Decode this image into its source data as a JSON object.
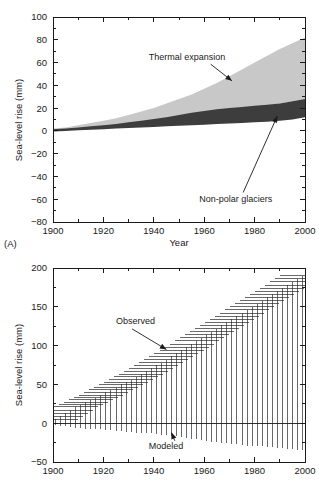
{
  "figure": {
    "panel_a_tag": "(A)",
    "axis_title_y": "Sea-level rise (mm)",
    "axis_title_x": "Year"
  },
  "panel_a": {
    "tag": "(A)",
    "ylabel": "Sea-level rise (mm)",
    "xlabel": "Year",
    "annotation_thermal": "Thermal expansion",
    "annotation_glaciers": "Non-polar glaciers"
  },
  "panel_b": {
    "ylabel": "Sea-level rise (mm)",
    "annotation_observed": "Observed",
    "annotation_modeled": "Modeled"
  },
  "colors": {
    "band_thermal": "#c8c8c8",
    "band_glaciers": "#3d3d3d",
    "axis": "#1a1a1a",
    "errorbar": "#2a2a2a",
    "background": "#ffffff"
  },
  "chart_data": [
    {
      "type": "area",
      "id": "panel-a",
      "title": "",
      "xlabel": "Year",
      "ylabel": "Sea-level rise (mm)",
      "xlim": [
        1900,
        2000
      ],
      "ylim": [
        -80,
        100
      ],
      "xticks": [
        1900,
        1920,
        1940,
        1960,
        1980,
        2000
      ],
      "yticks": [
        -80,
        -60,
        -40,
        -20,
        0,
        20,
        40,
        60,
        80,
        100
      ],
      "xtick_labels": [
        "1900",
        "1920",
        "1940",
        "1960",
        "1980",
        "2000"
      ],
      "ytick_labels": [
        "100",
        "80",
        "60",
        "40",
        "20",
        "0",
        "-20",
        "-40",
        "-60",
        "-80"
      ],
      "grid": false,
      "legend": "annotations",
      "annotations": [
        {
          "text": "Thermal expansion",
          "x": 1938,
          "y": 62,
          "arrow_to_x": 1971,
          "arrow_to_y": 44
        },
        {
          "text": "Non-polar glaciers",
          "x": 1958,
          "y": -62,
          "arrow_to_x": 1989,
          "arrow_to_y": 13
        }
      ],
      "x": [
        1900,
        1905,
        1910,
        1915,
        1920,
        1925,
        1930,
        1935,
        1940,
        1945,
        1950,
        1955,
        1960,
        1965,
        1970,
        1975,
        1980,
        1985,
        1990,
        1995,
        2000
      ],
      "series": [
        {
          "name": "Thermal expansion",
          "color": "#c8c8c8",
          "upper": [
            2,
            3,
            5,
            7,
            9,
            11,
            14,
            17,
            20,
            24,
            28,
            32,
            37,
            42,
            48,
            54,
            60,
            66,
            72,
            77,
            82
          ],
          "lower": [
            0,
            0.5,
            1,
            1.5,
            2,
            3,
            4,
            5,
            6,
            7,
            9,
            10,
            12,
            14,
            16,
            18,
            20,
            22,
            24,
            26,
            28
          ]
        },
        {
          "name": "Non-polar glaciers",
          "color": "#3d3d3d",
          "upper": [
            1.5,
            2,
            3,
            4,
            5,
            6,
            7.5,
            9,
            10.5,
            12,
            14,
            16,
            17.5,
            19,
            20,
            21,
            22,
            23,
            24,
            26,
            28
          ],
          "lower": [
            -0.5,
            0,
            0.5,
            1,
            1.5,
            2,
            2.5,
            3,
            3.5,
            4,
            4.5,
            5,
            5.5,
            6,
            6.5,
            7,
            7.5,
            8,
            9,
            10,
            12
          ]
        }
      ]
    },
    {
      "type": "errorbar",
      "id": "panel-b",
      "title": "",
      "xlabel": "",
      "ylabel": "Sea-level rise (mm)",
      "xlim": [
        1900,
        2000
      ],
      "ylim": [
        -50,
        200
      ],
      "xticks": [
        1900,
        1920,
        1940,
        1960,
        1980,
        2000
      ],
      "yticks": [
        -50,
        0,
        50,
        100,
        150,
        200
      ],
      "xtick_labels": [
        "1900",
        "1920",
        "1940",
        "1960",
        "1980",
        "2000"
      ],
      "ytick_labels": [
        "200",
        "150",
        "100",
        "50",
        "0",
        "-50"
      ],
      "grid": false,
      "annotations": [
        {
          "text": "Observed",
          "x": 1925,
          "y": 128,
          "arrow_to_x": 1945,
          "arrow_to_y": 95
        },
        {
          "text": "Modeled",
          "x": 1938,
          "y": -33,
          "arrow_to_x": 1947,
          "arrow_to_y": -12
        }
      ],
      "x": [
        1901,
        1903,
        1905,
        1907,
        1909,
        1911,
        1913,
        1915,
        1917,
        1919,
        1921,
        1923,
        1925,
        1927,
        1929,
        1931,
        1933,
        1935,
        1937,
        1939,
        1941,
        1943,
        1945,
        1947,
        1949,
        1951,
        1953,
        1955,
        1957,
        1959,
        1961,
        1963,
        1965,
        1967,
        1969,
        1971,
        1973,
        1975,
        1977,
        1979,
        1981,
        1983,
        1985,
        1987,
        1989,
        1991,
        1993,
        1995,
        1997,
        1999
      ],
      "series": [
        {
          "name": "Observed and modeled sea-level rise range",
          "upper": [
            5,
            9,
            13,
            17,
            21,
            24,
            27,
            30,
            33,
            36,
            40,
            43,
            46,
            50,
            53,
            56,
            60,
            63,
            67,
            71,
            75,
            78,
            82,
            86,
            90,
            94,
            98,
            102,
            106,
            110,
            114,
            118,
            122,
            126,
            130,
            134,
            138,
            142,
            146,
            150,
            154,
            158,
            162,
            166,
            170,
            174,
            178,
            182,
            186,
            190
          ],
          "lower": [
            -2,
            -3,
            -4,
            -5,
            -6,
            -6,
            -7,
            -7,
            -8,
            -8,
            -9,
            -9,
            -10,
            -10,
            -11,
            -11,
            -12,
            -12,
            -13,
            -13,
            -14,
            -15,
            -15,
            -16,
            -17,
            -18,
            -19,
            -20,
            -21,
            -22,
            -23,
            -24,
            -24,
            -25,
            -26,
            -27,
            -27,
            -28,
            -29,
            -29,
            -30,
            -30,
            -31,
            -31,
            -32,
            -32,
            -33,
            -33,
            -34,
            -34
          ]
        }
      ]
    }
  ]
}
